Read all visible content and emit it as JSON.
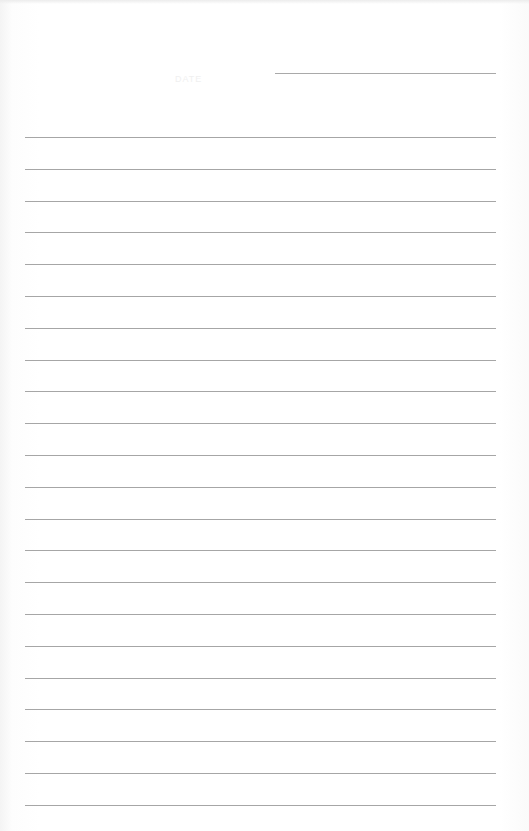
{
  "document": {
    "type": "lined-paper",
    "date_label": "DATE",
    "line_color": "#a6a6a6",
    "background_color": "#ffffff",
    "rule_count": 22,
    "rule_spacing_px": 31.8
  }
}
